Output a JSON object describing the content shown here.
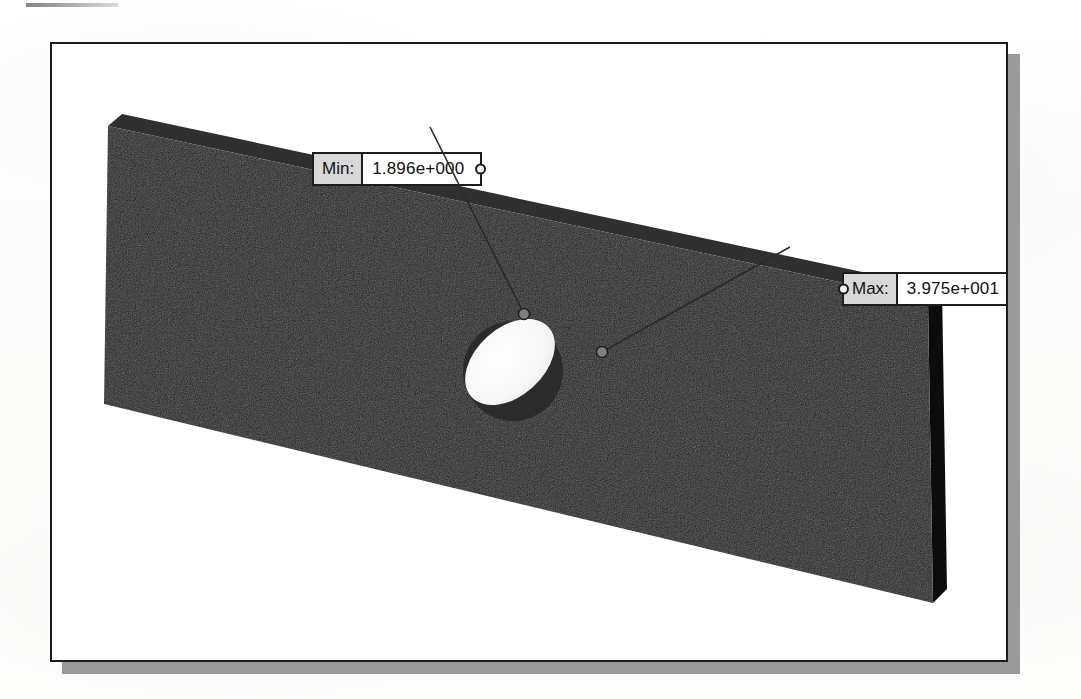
{
  "document": {
    "kind": "scanned-figure-page",
    "background_color": "#fcfcfc"
  },
  "figure": {
    "frame_border_color": "#1b1b1b",
    "frame_background": "#ffffff",
    "shadow_color": "#9a9a9a",
    "model": {
      "name": "plate-with-hole",
      "body_color": "#1a1a1a",
      "top_edge_color": "#2c2c2c",
      "right_edge_color": "#0d0d0d",
      "hole_color": "#fbfbfb",
      "hole_shadow_color": "#2a2a2a",
      "description": "Rectangular flat plate in isometric view containing one through hole"
    },
    "callouts": [
      {
        "id": "min",
        "tag": "Min:",
        "value": "1.896e+000",
        "anchor_side": "right",
        "marker_point": {
          "x": 522,
          "y": 312
        }
      },
      {
        "id": "max",
        "tag": "Max:",
        "value": "3.975e+001",
        "anchor_side": "left",
        "marker_point": {
          "x": 600,
          "y": 350
        }
      }
    ]
  }
}
